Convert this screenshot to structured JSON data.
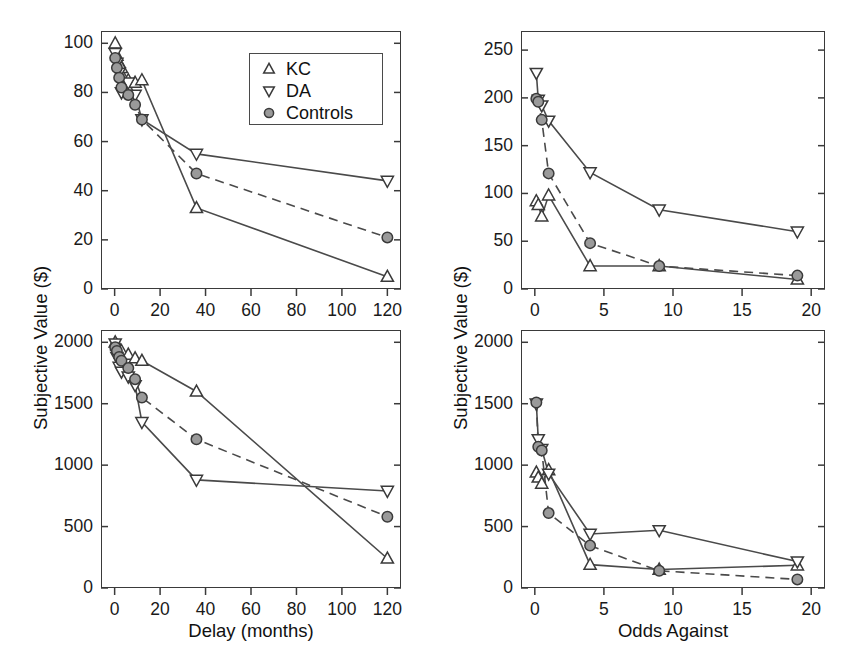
{
  "figure": {
    "panel_count": 4,
    "marker_colors": {
      "line": "#4a4a4a",
      "marker_edge": "#3a3a3a",
      "controls_fill": "#9a9a9a",
      "open_fill": "#ffffff"
    }
  },
  "legend": {
    "position": "top-left-panel-upper-right",
    "entries": [
      {
        "label": "KC",
        "marker": "triangle-up-open-icon"
      },
      {
        "label": "DA",
        "marker": "triangle-down-open-icon"
      },
      {
        "label": "Controls",
        "marker": "circle-filled-icon"
      }
    ]
  },
  "axis_titles": {
    "y_left": "Subjective Value ($)",
    "y_right": "Subjective Value ($)",
    "x_left": "Delay (months)",
    "x_right": "Odds Against"
  },
  "chart_data": [
    {
      "id": "top-left",
      "type": "line",
      "title": "",
      "xlabel": "Delay (months)",
      "ylabel": "Subjective Value ($)",
      "xlim": [
        -6,
        126
      ],
      "ylim": [
        0,
        105
      ],
      "xticks": [
        0,
        20,
        40,
        60,
        80,
        100,
        120
      ],
      "yticks": [
        0,
        20,
        40,
        60,
        80,
        100
      ],
      "grid": false,
      "legend": "upper right",
      "series": [
        {
          "name": "KC",
          "marker": "triangle-up",
          "line": "solid",
          "x": [
            0.25,
            1,
            2,
            3,
            6,
            9,
            12,
            36,
            120
          ],
          "y": [
            100,
            95,
            92,
            90,
            85,
            84,
            85,
            33,
            5
          ]
        },
        {
          "name": "DA",
          "marker": "triangle-down",
          "line": "solid",
          "x": [
            0.25,
            1,
            2,
            3,
            6,
            9,
            12,
            36,
            120
          ],
          "y": [
            96,
            92,
            88,
            80,
            84,
            79,
            69,
            55,
            44
          ]
        },
        {
          "name": "Controls",
          "marker": "circle",
          "line": "dashed",
          "x": [
            0.25,
            1,
            2,
            3,
            6,
            9,
            12,
            36,
            120
          ],
          "y": [
            94,
            90,
            86,
            82,
            79,
            75,
            69,
            47,
            21
          ]
        }
      ]
    },
    {
      "id": "bottom-left",
      "type": "line",
      "title": "",
      "xlabel": "Delay (months)",
      "ylabel": "Subjective Value ($)",
      "xlim": [
        -6,
        126
      ],
      "ylim": [
        0,
        2100
      ],
      "xticks": [
        0,
        20,
        40,
        60,
        80,
        100,
        120
      ],
      "yticks": [
        0,
        500,
        1000,
        1500,
        2000
      ],
      "grid": false,
      "legend": "none",
      "series": [
        {
          "name": "KC",
          "marker": "triangle-up",
          "line": "solid",
          "x": [
            0.25,
            1,
            2,
            3,
            6,
            9,
            12,
            36,
            120
          ],
          "y": [
            2000,
            1975,
            1950,
            1930,
            1900,
            1870,
            1850,
            1600,
            240
          ]
        },
        {
          "name": "DA",
          "marker": "triangle-down",
          "line": "solid",
          "x": [
            0.25,
            1,
            2,
            3,
            6,
            9,
            12,
            36,
            120
          ],
          "y": [
            1990,
            1880,
            1800,
            1760,
            1720,
            1650,
            1350,
            880,
            790
          ]
        },
        {
          "name": "Controls",
          "marker": "circle",
          "line": "dashed",
          "x": [
            0.25,
            1,
            2,
            3,
            6,
            9,
            12,
            36,
            120
          ],
          "y": [
            1960,
            1930,
            1880,
            1850,
            1790,
            1700,
            1550,
            1210,
            580
          ]
        }
      ]
    },
    {
      "id": "top-right",
      "type": "line",
      "title": "",
      "xlabel": "Odds Against",
      "ylabel": "Subjective Value ($)",
      "xlim": [
        -1,
        21
      ],
      "ylim": [
        0,
        270
      ],
      "xticks": [
        0,
        5,
        10,
        15,
        20
      ],
      "yticks": [
        0,
        50,
        100,
        150,
        200,
        250
      ],
      "grid": false,
      "legend": "none",
      "series": [
        {
          "name": "KC",
          "marker": "triangle-up",
          "line": "solid",
          "x": [
            0.11,
            0.25,
            0.5,
            1,
            4,
            9,
            19
          ],
          "y": [
            92,
            88,
            76,
            98,
            24,
            24,
            10
          ]
        },
        {
          "name": "DA",
          "marker": "triangle-down",
          "line": "solid",
          "x": [
            0.11,
            0.25,
            0.5,
            1,
            4,
            9,
            19
          ],
          "y": [
            226,
            198,
            192,
            176,
            122,
            83,
            60
          ]
        },
        {
          "name": "Controls",
          "marker": "circle",
          "line": "dashed",
          "x": [
            0.11,
            0.25,
            0.5,
            1,
            4,
            9,
            19
          ],
          "y": [
            199,
            196,
            177,
            121,
            48,
            24,
            14
          ]
        }
      ]
    },
    {
      "id": "bottom-right",
      "type": "line",
      "title": "",
      "xlabel": "Odds Against",
      "ylabel": "Subjective Value ($)",
      "xlim": [
        -1,
        21
      ],
      "ylim": [
        0,
        2100
      ],
      "xticks": [
        0,
        5,
        10,
        15,
        20
      ],
      "yticks": [
        0,
        500,
        1000,
        1500,
        2000
      ],
      "grid": false,
      "legend": "none",
      "series": [
        {
          "name": "KC",
          "marker": "triangle-up",
          "line": "solid",
          "x": [
            0.11,
            0.25,
            0.5,
            1,
            4,
            9,
            19
          ],
          "y": [
            940,
            900,
            850,
            960,
            190,
            150,
            185
          ]
        },
        {
          "name": "DA",
          "marker": "triangle-down",
          "line": "solid",
          "x": [
            0.11,
            0.25,
            0.5,
            1,
            4,
            9,
            19
          ],
          "y": [
            1500,
            1210,
            1130,
            930,
            440,
            470,
            215
          ]
        },
        {
          "name": "Controls",
          "marker": "circle",
          "line": "dashed",
          "x": [
            0.11,
            0.25,
            0.5,
            1,
            4,
            9,
            19
          ],
          "y": [
            1510,
            1150,
            1120,
            610,
            345,
            140,
            70
          ]
        }
      ]
    }
  ]
}
